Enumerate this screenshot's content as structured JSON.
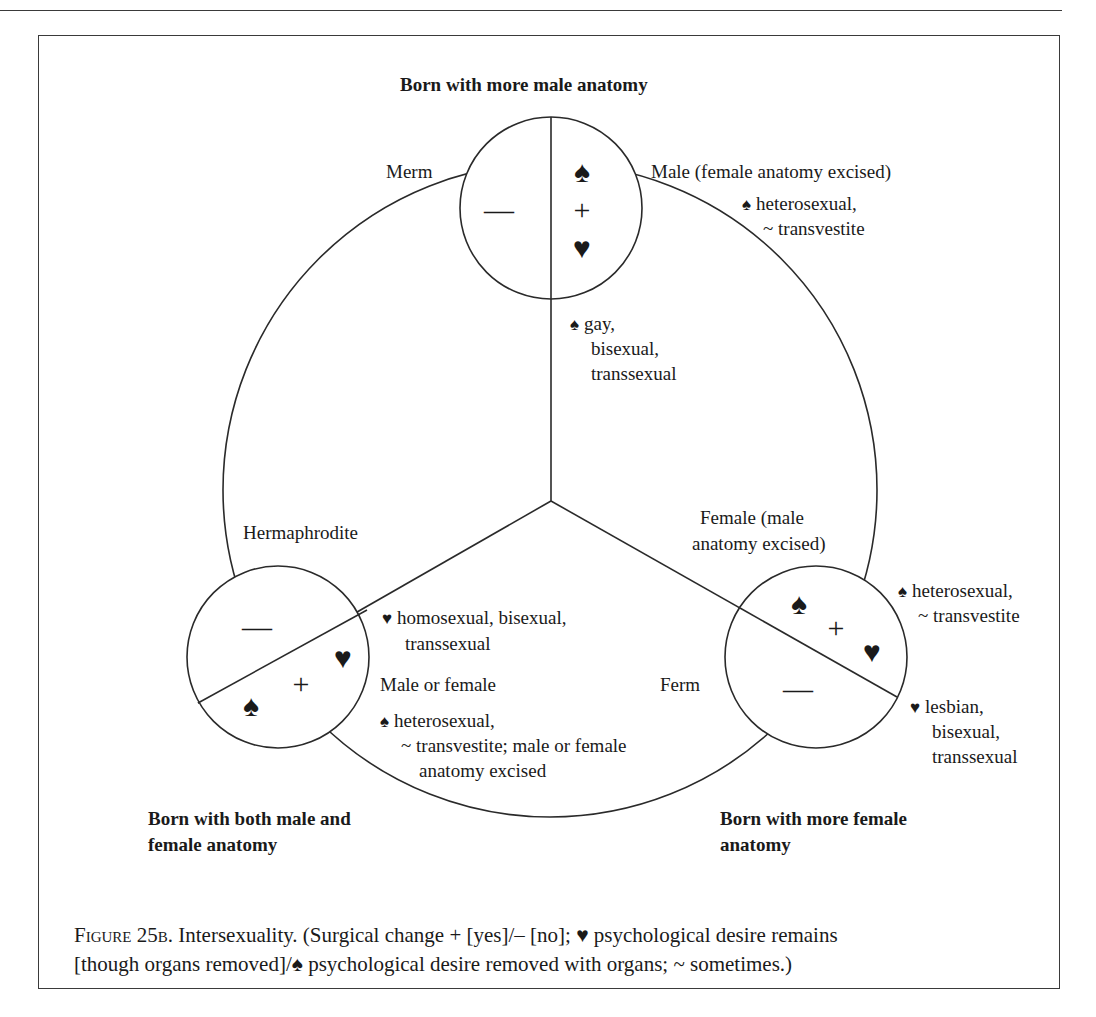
{
  "heading_top": "Born with more male anatomy",
  "heading_bottom_left": [
    "Born with both male and",
    "female anatomy"
  ],
  "heading_bottom_right": [
    "Born with more female",
    "anatomy"
  ],
  "symbols": {
    "spade": "♠",
    "heart": "♥",
    "plus": "+",
    "minus": "—",
    "tilde": "~"
  },
  "nodes": {
    "top": {
      "left_label": "Merm",
      "right_label": "Male (female anatomy excised)",
      "right_note": [
        "heterosexual,",
        "~ transvestite"
      ],
      "inner_note": [
        "gay,",
        "bisexual,",
        "transsexual"
      ]
    },
    "bottom_left": {
      "label": "Hermaphrodite",
      "heart_note": [
        "homosexual, bisexual,",
        "transsexual"
      ],
      "right_label": "Male or female",
      "spade_note": [
        "heterosexual,",
        "~ transvestite; male or female",
        "anatomy excised"
      ]
    },
    "bottom_right": {
      "label": [
        "Female (male",
        "anatomy excised)"
      ],
      "left_label": "Ferm",
      "spade_note": [
        "heterosexual,",
        "~ transvestite"
      ],
      "heart_note": [
        "lesbian,",
        "bisexual,",
        "transsexual"
      ]
    }
  },
  "caption": {
    "figure_label": "Figure 25b.",
    "line1": " Intersexuality. (Surgical change + [yes]/– [no]; ♥ psychological desire remains",
    "line2": "[though organs removed]/♠ psychological desire removed with organs; ~ sometimes.)"
  },
  "colors": {
    "ink": "#1a1a1a",
    "rule": "#3a3a3a",
    "background": "#ffffff"
  }
}
